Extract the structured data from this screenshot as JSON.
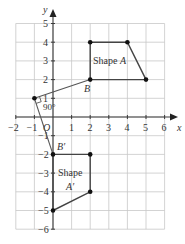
{
  "diagram": {
    "x_axis_label": "x",
    "y_axis_label": "y",
    "origin_label": "O",
    "x_range": [
      -2,
      6
    ],
    "y_range": [
      -6,
      5
    ],
    "x_ticks": [
      "−2",
      "−1",
      "1",
      "2",
      "3",
      "4",
      "5",
      "6"
    ],
    "y_ticks": [
      "5",
      "4",
      "3",
      "2",
      "1",
      "−1",
      "−2",
      "−3",
      "−4",
      "−5",
      "−6"
    ],
    "shape_a": {
      "label": "Shape A",
      "label_part1": "Shape",
      "label_part2": "A",
      "vertices": [
        [
          2,
          2
        ],
        [
          2,
          4
        ],
        [
          4,
          4
        ],
        [
          5,
          2
        ]
      ]
    },
    "shape_a_prime": {
      "label_part1": "Shape",
      "label_part2": "A′",
      "vertices": [
        [
          0,
          -2
        ],
        [
          2,
          -2
        ],
        [
          2,
          -4
        ],
        [
          0,
          -5
        ]
      ]
    },
    "center_of_rotation": [
      -1,
      1
    ],
    "point_b": {
      "label": "B",
      "coords": [
        2,
        2
      ]
    },
    "point_b_prime": {
      "label": "B′",
      "coords": [
        0,
        -2
      ]
    },
    "angle_label": "90°",
    "colors": {
      "grid": "#c8c8c8",
      "axis": "#3a3a3a",
      "shape": "#444444"
    }
  }
}
